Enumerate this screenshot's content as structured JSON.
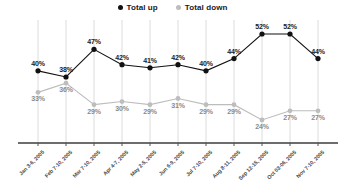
{
  "legend": {
    "position": "top-center",
    "items": [
      {
        "label": "Total up",
        "color": "#111111",
        "marker": "circle-dot-icon"
      },
      {
        "label": "Total down",
        "color": "#bdbdbd",
        "marker": "circle-dot-icon"
      }
    ]
  },
  "chart_data": {
    "type": "line",
    "title": "",
    "subtitle": "",
    "xlabel": "",
    "ylabel": "",
    "ylim": [
      0,
      60
    ],
    "grid": "vertical-only",
    "legend_position": "top-center",
    "categories": [
      "Jan 3-6, 2005",
      "Feb 7-10, 2005",
      "Mar 7-10, 2005",
      "Apr 4-7, 2005",
      "May 2-5, 2005",
      "Jun 6-9, 2005",
      "Jul 7-10, 2005",
      "Aug 8-11, 2005",
      "Sep 12-15, 2005",
      "Oct 03-06, 2005",
      "Nov 7-10, 2005"
    ],
    "series": [
      {
        "name": "Total up",
        "color": "#111111",
        "values": [
          40,
          38,
          47,
          42,
          41,
          42,
          40,
          44,
          52,
          52,
          44
        ],
        "labels": [
          "40%",
          "38%",
          "47%",
          "42%",
          "41%",
          "42%",
          "40%",
          "44%",
          "52%",
          "52%",
          "44%"
        ]
      },
      {
        "name": "Total down",
        "color": "#bdbdbd",
        "values": [
          33,
          36,
          29,
          30,
          29,
          31,
          29,
          29,
          24,
          27,
          27
        ],
        "labels": [
          "33%",
          "36%",
          "29%",
          "30%",
          "29%",
          "31%",
          "29%",
          "29%",
          "24%",
          "27%",
          "27%"
        ]
      }
    ]
  },
  "axis": {
    "baseline_color": "#3d3d3d",
    "gridline_color": "#dcdcdc",
    "tick_color": "#555555"
  }
}
